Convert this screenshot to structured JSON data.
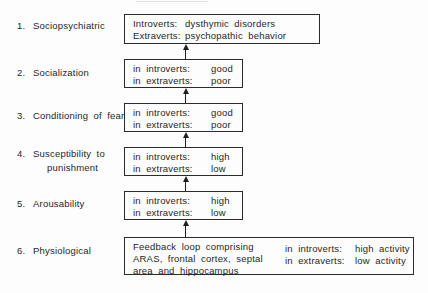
{
  "figure": {
    "colors": {
      "ink": "#1f1f1f",
      "border": "#2b2b2b",
      "background": "#fdfdfd"
    },
    "levels": [
      {
        "num": "1.",
        "label": "Sociopsychiatric",
        "rows": [
          {
            "k": "Introverts:",
            "v": "dysthymic disorders"
          },
          {
            "k": "Extraverts:",
            "v": "psychopathic behavior"
          }
        ]
      },
      {
        "num": "2.",
        "label": "Socialization",
        "rows": [
          {
            "k": "in introverts:",
            "v": "good"
          },
          {
            "k": "in extraverts:",
            "v": "poor"
          }
        ]
      },
      {
        "num": "3.",
        "label": "Conditioning of fear",
        "rows": [
          {
            "k": "in introverts:",
            "v": "good"
          },
          {
            "k": "in extraverts:",
            "v": "poor"
          }
        ]
      },
      {
        "num": "4.",
        "label": "Susceptibility to",
        "label_line2": "punishment",
        "rows": [
          {
            "k": "in introverts:",
            "v": "high"
          },
          {
            "k": "in extraverts:",
            "v": "low"
          }
        ]
      },
      {
        "num": "5.",
        "label": "Arousability",
        "rows": [
          {
            "k": "in introverts:",
            "v": "high"
          },
          {
            "k": "in extraverts:",
            "v": "low"
          }
        ]
      },
      {
        "num": "6.",
        "label": "Physiological",
        "feedback": [
          "Feedback loop comprising",
          "ARAS, frontal cortex, septal",
          "area and hippocampus"
        ],
        "rows": [
          {
            "k": "in introverts:",
            "v": "high activity"
          },
          {
            "k": "in extraverts:",
            "v": "low activity"
          }
        ]
      }
    ]
  }
}
